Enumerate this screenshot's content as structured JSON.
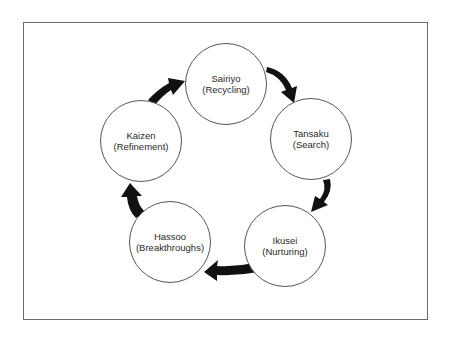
{
  "diagram": {
    "type": "cycle",
    "frame": {
      "x": 23,
      "y": 22,
      "width": 405,
      "height": 298
    },
    "colors": {
      "stroke": "#555555",
      "arrow": "#111111",
      "text": "#2a2a2a",
      "background": "#ffffff"
    },
    "nodes": [
      {
        "id": "sairiyo",
        "label": "Sairiyo",
        "sublabel": "(Recycling)",
        "cx": 226,
        "cy": 84
      },
      {
        "id": "tansaku",
        "label": "Tansaku",
        "sublabel": "(Search)",
        "cx": 311,
        "cy": 139
      },
      {
        "id": "ikusei",
        "label": "Ikusei",
        "sublabel": "(Nurturing)",
        "cx": 285,
        "cy": 246
      },
      {
        "id": "hassoo",
        "label": "Hassoo",
        "sublabel": "(Breakthroughs)",
        "cx": 170,
        "cy": 242
      },
      {
        "id": "kaizen",
        "label": "Kaizen",
        "sublabel": "(Refinement)",
        "cx": 141,
        "cy": 141
      }
    ],
    "edges": [
      {
        "from": "sairiyo",
        "to": "tansaku"
      },
      {
        "from": "tansaku",
        "to": "ikusei"
      },
      {
        "from": "ikusei",
        "to": "hassoo"
      },
      {
        "from": "hassoo",
        "to": "kaizen"
      },
      {
        "from": "kaizen",
        "to": "sairiyo"
      }
    ]
  }
}
